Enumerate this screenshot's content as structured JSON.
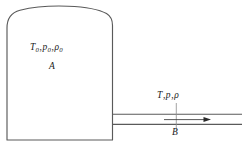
{
  "figure": {
    "line_color": "#5a5a5a",
    "text_color": "#1a1a1a",
    "background": "#ffffff",
    "tank": {
      "region_label": "A",
      "state_symbol_T": "T",
      "state_symbol_p": "p",
      "state_symbol_rho": "ρ",
      "state_subscript": "0",
      "separator": ","
    },
    "pipe": {
      "region_label": "B",
      "state_symbol_T": "T",
      "state_symbol_p": "p",
      "state_symbol_rho": "ρ",
      "separator": ",",
      "flow_direction": "right"
    },
    "caption": ""
  }
}
